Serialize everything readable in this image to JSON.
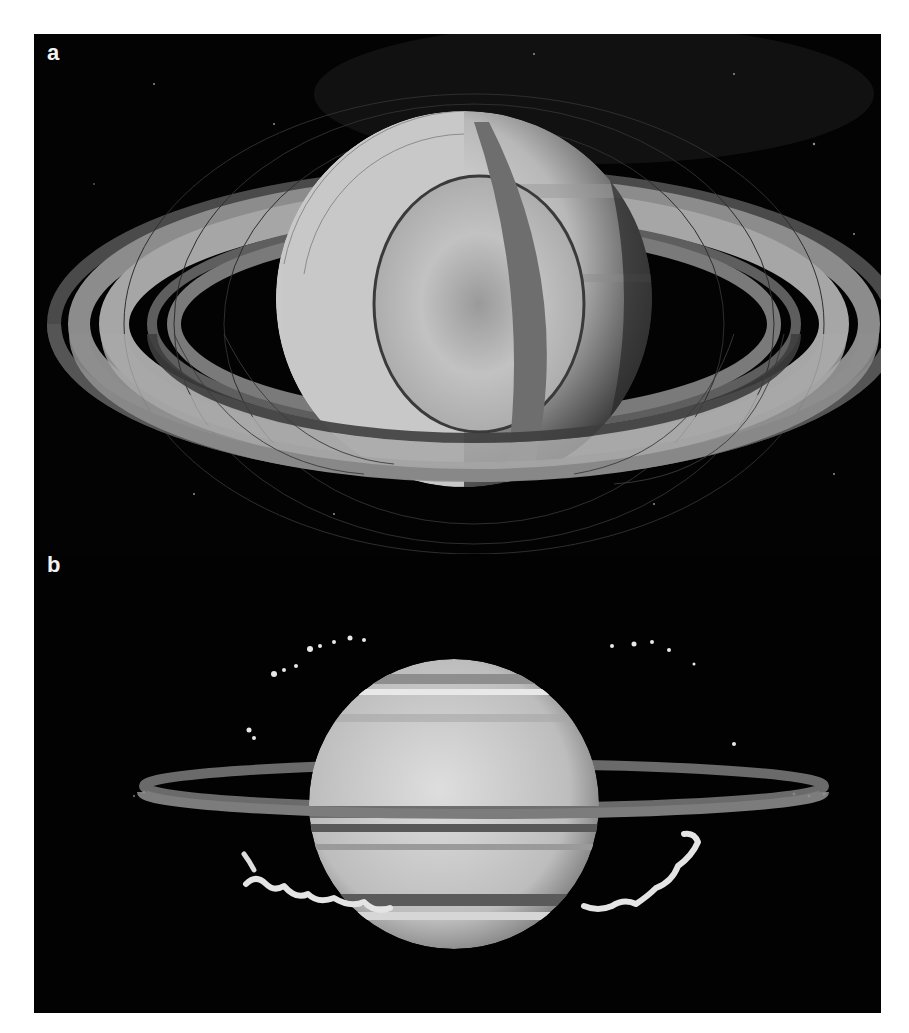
{
  "figure": {
    "panels": [
      {
        "label": "a",
        "description": "Cutaway illustration of Saturn showing interior layers, surrounded by its ring system with field lines, against a starfield"
      },
      {
        "label": "b",
        "description": "Image of Saturn with equatorial rings seen nearly edge-on and bright auroral/cloud-like features arcing above and below the rings"
      }
    ],
    "colors": {
      "background": "#020202",
      "planet_light": "#d8d8d8",
      "ring_mid": "#8a8a8a",
      "label": "#f2f2f2"
    }
  }
}
